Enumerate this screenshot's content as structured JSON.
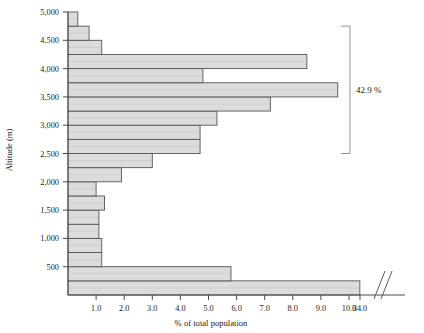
{
  "chart_data": {
    "type": "bar",
    "orientation": "horizontal",
    "title": "",
    "xlabel": "% of total population",
    "ylabel": "Altitude (m)",
    "xlim": [
      0,
      11.6
    ],
    "ylim": [
      0,
      5000
    ],
    "grid": false,
    "axis_break": {
      "present": true,
      "after": 10.0,
      "resumes_at": 34.0,
      "symbol": "//"
    },
    "xticks": [
      1.0,
      2.0,
      3.0,
      4.0,
      5.0,
      6.0,
      7.0,
      8.0,
      9.0,
      10.0,
      34.0
    ],
    "xticklabels": [
      "1.0",
      "2.0",
      "3.0",
      "4.0",
      "5.0",
      "6.0",
      "7.0",
      "8.0",
      "9.0",
      "10.0",
      "34.0"
    ],
    "yticks": [
      500,
      1000,
      1500,
      2000,
      2500,
      3000,
      3500,
      4000,
      4500,
      5000
    ],
    "yticklabels": [
      "500",
      "1,000",
      "1,500",
      "2,000",
      "2,500",
      "3,000",
      "3,500",
      "4,000",
      "4,500",
      "5,000"
    ],
    "band_size_m": 250,
    "categories": [
      "0-250",
      "250-500",
      "500-750",
      "750-1,000",
      "1,000-1,250",
      "1,250-1,500",
      "1,500-1,750",
      "1,750-2,000",
      "2,000-2,250",
      "2,250-2,500",
      "2,500-2,750",
      "2,750-3,000",
      "3,000-3,250",
      "3,250-3,500",
      "3,500-3,750",
      "3,750-4,000",
      "4,000-4,250",
      "4,250-4,500",
      "4,500-4,750",
      "4,750-5,000"
    ],
    "values": [
      34.3,
      5.8,
      1.2,
      1.2,
      1.1,
      1.1,
      1.3,
      1.0,
      1.9,
      3.0,
      4.7,
      4.7,
      5.3,
      7.2,
      9.6,
      4.8,
      8.5,
      1.2,
      0.75,
      0.35
    ],
    "annotations": [
      {
        "text": "42.9 %",
        "type": "bracket",
        "from_altitude": 2500,
        "to_altitude": 4750,
        "description": "bracket spanning the 2,500 m to 4,750 m altitude bands"
      }
    ],
    "bar_fill": "#dcdcdc",
    "bar_edge": "#555555",
    "axis_color": "#4a4a4a"
  },
  "labels": {
    "xaxis_title": "% of total population",
    "yaxis_title": "Altitude (m)",
    "bracket_value": "42.9 %"
  }
}
